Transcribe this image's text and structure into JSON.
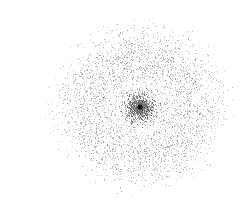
{
  "figure": {
    "width": 205,
    "height": 185,
    "background_color": "#ffffff",
    "title": "",
    "axes_visible": false,
    "frame_visible": false
  },
  "chart_data": {
    "type": "scatter",
    "title": "",
    "subtitle": "",
    "xlabel": "",
    "ylabel": "",
    "grid": false,
    "legend": null,
    "axes_visible": false,
    "tick_labels": [],
    "annotations": [],
    "description": "Rotationally symmetric radial point cloud: a dense Gaussian core with a solid dark centre marker, a sparse gap annulus, and a broad diffuse outer ring that fades to the edges.",
    "center": {
      "x": 100,
      "y": 91
    },
    "xlim": [
      0,
      205
    ],
    "ylim": [
      0,
      185
    ],
    "point_size_px": 1,
    "point_color": "#808080",
    "total_points": 5200,
    "series": [
      {
        "name": "central-core",
        "kind": "gaussian-blob",
        "point_count": 1500,
        "radius_mean": 0,
        "radius_sigma": 9.5,
        "radius_max": 22,
        "color": "#6e6e6e",
        "alpha": 0.85,
        "point_size_px": 1
      },
      {
        "name": "gap-annulus",
        "kind": "sparse-ring",
        "point_count": 260,
        "radius_mean": 31,
        "radius_sigma": 7,
        "radius_max": 40,
        "color": "#b8b8b8",
        "alpha": 0.5,
        "point_size_px": 1
      },
      {
        "name": "outer-ring",
        "kind": "annulus",
        "point_count": 3440,
        "radius_mean": 57,
        "radius_sigma": 17,
        "radius_max": 96,
        "color": "#8f8f8f",
        "alpha": 0.7,
        "point_size_px": 1
      }
    ],
    "core_marker": {
      "name": "center-marker",
      "x": 100,
      "y": 91,
      "radius_px": 2.6,
      "color": "#141414",
      "shape": "circle"
    },
    "aspect": {
      "x_scale": 1.0,
      "y_scale": 0.94
    },
    "radial_density_profile": {
      "radius": [
        0,
        5,
        10,
        15,
        20,
        25,
        30,
        35,
        40,
        45,
        50,
        55,
        60,
        65,
        70,
        75,
        80,
        85,
        90,
        95,
        100
      ],
      "relative_density": [
        1.0,
        0.92,
        0.68,
        0.36,
        0.15,
        0.07,
        0.06,
        0.09,
        0.16,
        0.27,
        0.38,
        0.44,
        0.44,
        0.4,
        0.33,
        0.25,
        0.18,
        0.11,
        0.06,
        0.02,
        0.0
      ]
    }
  }
}
